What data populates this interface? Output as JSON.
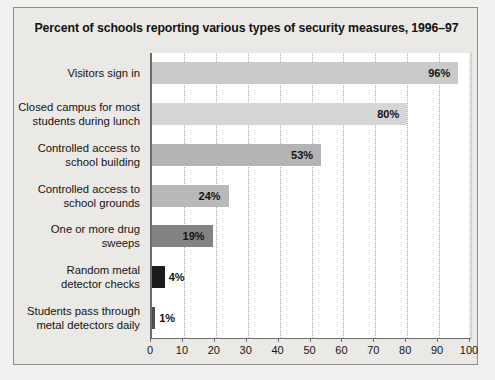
{
  "figure": {
    "title": "Percent of schools reporting various types of security measures, 1996–97"
  },
  "chart_data": {
    "type": "bar",
    "orientation": "horizontal",
    "title": "Percent of schools reporting various types of security measures, 1996–97",
    "xlabel": "",
    "ylabel": "",
    "xlim": [
      0,
      100
    ],
    "grid": "vertical-dotted",
    "legend": "none",
    "categories": [
      "Visitors sign in",
      "Closed campus for most\nstudents during lunch",
      "Controlled access to\nschool building",
      "Controlled access to\nschool grounds",
      "One or more drug\nsweeps",
      "Random metal\ndetector checks",
      "Students pass through\nmetal detectors daily"
    ],
    "values": [
      96,
      80,
      53,
      24,
      19,
      4,
      1
    ],
    "value_labels": [
      "96%",
      "80%",
      "53%",
      "24%",
      "19%",
      "4%",
      "1%"
    ],
    "bar_colors": [
      "#c9c9c9",
      "#d6d6d6",
      "#b4b4b4",
      "#b9b9b9",
      "#838383",
      "#1c1c1c",
      "#4d4d4d"
    ],
    "xticks": [
      0,
      10,
      20,
      30,
      40,
      50,
      60,
      70,
      80,
      90,
      100
    ],
    "xtick_labels": [
      "0",
      "10",
      "20",
      "30",
      "40",
      "50",
      "60",
      "70",
      "80",
      "90",
      "100"
    ]
  }
}
